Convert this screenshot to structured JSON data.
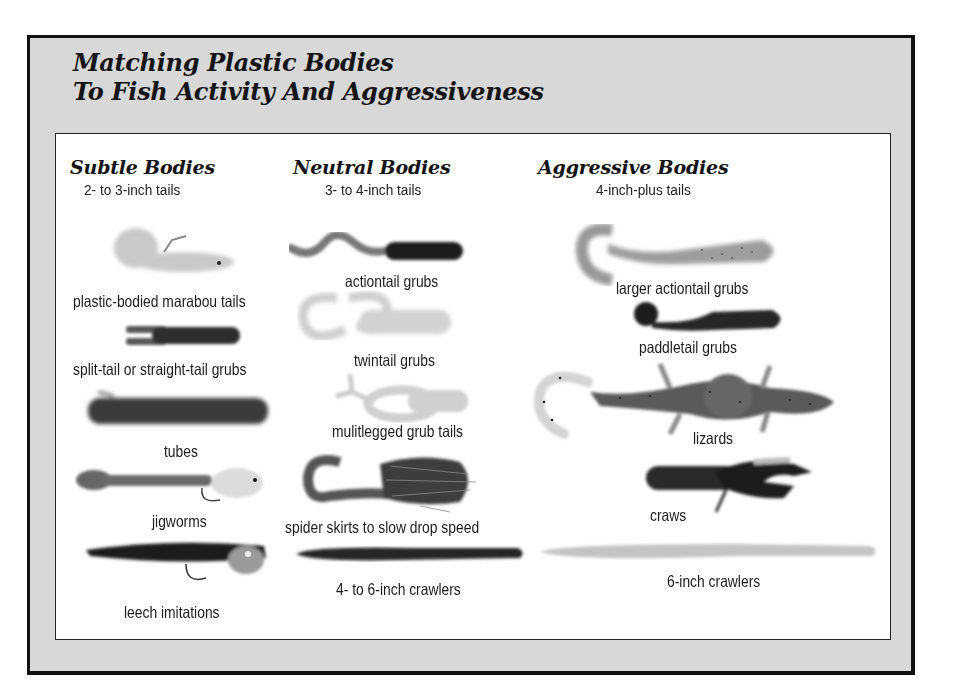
{
  "figure": {
    "title_line1": "Matching Plastic Bodies",
    "title_line2": "To Fish Activity And Aggressiveness",
    "colors": {
      "panel": "#d8d8d8",
      "border": "#111111",
      "inner": "#ffffff",
      "text": "#1c1c1c"
    }
  },
  "columns": [
    {
      "heading": "Subtle Bodies",
      "subheading": "2- to 3-inch tails",
      "items": [
        {
          "label": "plastic-bodied marabou tails",
          "icon": "marabou-jig-icon"
        },
        {
          "label": "split-tail or straight-tail grubs",
          "icon": "split-tail-grub-icon"
        },
        {
          "label": "tubes",
          "icon": "tube-icon"
        },
        {
          "label": "jigworms",
          "icon": "jigworm-icon"
        },
        {
          "label": "leech imitations",
          "icon": "leech-icon"
        }
      ]
    },
    {
      "heading": "Neutral Bodies",
      "subheading": "3- to 4-inch tails",
      "items": [
        {
          "label": "actiontail grubs",
          "icon": "actiontail-grub-icon"
        },
        {
          "label": "twintail grubs",
          "icon": "twintail-grub-icon"
        },
        {
          "label": "mulitlegged grub tails",
          "icon": "multilegged-grub-icon"
        },
        {
          "label": "spider skirts to slow drop speed",
          "icon": "spider-skirt-grub-icon"
        },
        {
          "label": "4- to 6-inch crawlers",
          "icon": "crawler-icon"
        }
      ]
    },
    {
      "heading": "Aggressive Bodies",
      "subheading": "4-inch-plus tails",
      "items": [
        {
          "label": "larger actiontail grubs",
          "icon": "large-actiontail-grub-icon"
        },
        {
          "label": "paddletail grubs",
          "icon": "paddletail-grub-icon"
        },
        {
          "label": "lizards",
          "icon": "lizard-icon"
        },
        {
          "label": "craws",
          "icon": "craw-icon"
        },
        {
          "label": "6-inch crawlers",
          "icon": "long-crawler-icon"
        }
      ]
    }
  ]
}
